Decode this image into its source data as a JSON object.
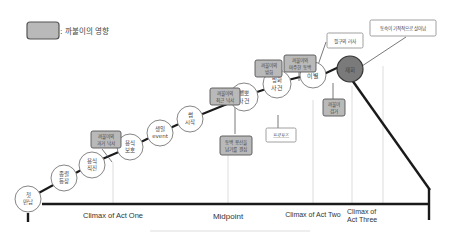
{
  "legend": {
    "label": ": 까불이의 영향",
    "swatch_color": "#b9b9b9"
  },
  "colors": {
    "node_fill": "#ffffff",
    "node_stroke": "#777777",
    "influence_fill": "#b9b9b9",
    "influence_stroke": "#555555",
    "climax_fill": "#7a7a7a",
    "line": "#222222",
    "guide": "#cfcfcf"
  },
  "nodes": [
    {
      "id": "n1",
      "line1": "첫",
      "line2": "만남"
    },
    {
      "id": "n2",
      "line1": "종렬",
      "line2": "등장"
    },
    {
      "id": "n3",
      "line1": "용식",
      "line2": "직진"
    },
    {
      "id": "n4",
      "line1": "용식",
      "line2": "보호"
    },
    {
      "id": "n5",
      "line1": "생일",
      "line2": "event"
    },
    {
      "id": "n6",
      "line1": "썸",
      "line2": "시작"
    },
    {
      "id": "n7",
      "line1": "뺑뽀",
      "line2": "사건"
    },
    {
      "id": "n8",
      "line1": "방화",
      "line2": "사건"
    },
    {
      "id": "n9",
      "line1": "이별",
      "line2": ""
    },
    {
      "id": "n10",
      "line1": "재회",
      "line2": ""
    }
  ],
  "influence_boxes": [
    {
      "id": "b1",
      "line1": "까불이의",
      "line2": "과거 낙서"
    },
    {
      "id": "b2",
      "line1": "까불이의",
      "line2": "최근 낙서"
    },
    {
      "id": "b3",
      "line1": "동백 용산을",
      "line2": "남기를 결심"
    },
    {
      "id": "b4",
      "line1": "까불이의",
      "line2": "방화"
    },
    {
      "id": "b5",
      "line1": "까불이와",
      "line2": "마주한 동백"
    },
    {
      "id": "b6",
      "line1": "까불이",
      "line2": "검거"
    }
  ],
  "callouts": [
    {
      "id": "c1",
      "text": "프로포즈"
    },
    {
      "id": "c2",
      "text": "필구의 러사"
    },
    {
      "id": "c3",
      "text": "동숙이 기적적으로 살아남"
    }
  ],
  "axis_labels": {
    "act_one": "Climax of Act One",
    "midpoint": "Midpoint",
    "act_two": "Climax of Act Two",
    "act_three_l1": "Climax of",
    "act_three_l2": "Act Three"
  }
}
